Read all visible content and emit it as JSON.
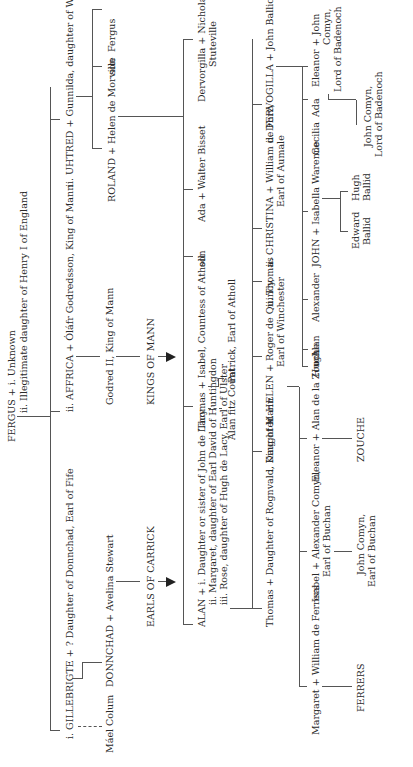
{
  "diagram": {
    "type": "family-tree",
    "root": {
      "name": "FERGUS + i. Unknown",
      "second_spouse": "ii. Illegitimate daughter of Henry I of England"
    },
    "gen1": {
      "gillebrigte": "i. GILLEBRIGTE + ? Daughter of Donnchad, Earl of Fife",
      "affrica": "ii. AFFRICA + Óláfr Godredsson, King of Mann",
      "uhtred": "ii. UHTRED + Gunnilda, daughter of Waltheof of Allerdale"
    },
    "gen2": {
      "mael_colum": "Máel Colum",
      "donnchad": "DONNCHAD + Avelina Stewart",
      "godred": "Godred II, King of Mann",
      "roland": "ROLAND + Helen de Morville",
      "son": "son",
      "fergus": "Fergus"
    },
    "lines": {
      "carrick": "EARLS OF CARRICK",
      "mann": "KINGS OF MANN"
    },
    "gen3": {
      "alan_1": "ALAN + i. Daughter or sister of John de Lacy",
      "alan_2": "ii. Margaret, daughter of Earl David of Huntingdon",
      "alan_3": "iii. Rose, daughter of Hugh de Lacy, Earl of Ulster",
      "thomas": "Thomas + Isabel, Countess of Atholl",
      "son": "son",
      "ada": "Ada + Walter Bisset",
      "dervorgilla": "Dervorgilla + Nicholas de",
      "dervorgilla_2": "Stuteville"
    },
    "gen3b": {
      "alan_fitz": "Alan fitz Count",
      "patrick": "Patrick, Earl of Atholl"
    },
    "gen4": {
      "thomas": "Thomas + Daughter of Rognvald, King of Mann",
      "daughter": "i. Daughter",
      "helen": "ii. HELEN + Roger de Quincy,",
      "helen_2": "Earl of Winchester",
      "thomas_ii": "ii. Thomas",
      "christina": "ii. CHRISTINA + William de Forz,",
      "christina_2": "Earl of Aumale",
      "dervogilla": "ii. DERVOGILLA + John Balliol"
    },
    "gen5": {
      "margaret": "Margaret + William de Ferrers",
      "isabel": "Isabel + Alexander Comyn,",
      "isabel_2": "Earl of Buchan",
      "eleanor": "Eleanor + Alan de la Zouche",
      "hugh": "Hugh",
      "alan": "Alan",
      "alexander": "Alexander",
      "john": "JOHN + Isabella Warenne",
      "cecilia": "Cecilia",
      "ada": "Ada",
      "eleanor_b": "Eleanor + John",
      "eleanor_b2": "Comyn,",
      "eleanor_b3": "Lord of Badenoch"
    },
    "gen6": {
      "ferrers": "FERRERS",
      "john_comyn_b1": "John Comyn,",
      "john_comyn_b2": "Earl of Buchan",
      "zouche": "ZOUCHE",
      "edward": "Edward",
      "edward_2": "Ballid",
      "hugh": "Hugh",
      "hugh_2": "Ballid",
      "john_comyn_l1": "John Comyn,",
      "john_comyn_l2": "Lord of Badenoch"
    }
  }
}
